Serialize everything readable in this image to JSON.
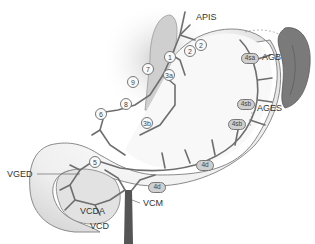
{
  "diagram": {
    "type": "anatomical-illustration",
    "colors": {
      "background": "#ffffff",
      "stomach_fill": "#e9e9e9",
      "vessel": "#6e6e6e",
      "spleen": "#7a7a7a",
      "portal_trunk": "#555555",
      "label_text": "#333333"
    },
    "labels": {
      "apis": "APIS",
      "agb": "AGB",
      "ages": "AGES",
      "vged": "VGED",
      "vcda": "VCDA",
      "vcm": "VCM",
      "vcd": "VCD"
    },
    "nodes": [
      {
        "id": "1",
        "label": "1"
      },
      {
        "id": "2a",
        "label": "2"
      },
      {
        "id": "2b",
        "label": "2"
      },
      {
        "id": "3a",
        "label": "3a"
      },
      {
        "id": "3b",
        "label": "3b"
      },
      {
        "id": "4sa",
        "label": "4sa"
      },
      {
        "id": "4sb1",
        "label": "4sb"
      },
      {
        "id": "4sb2",
        "label": "4sb"
      },
      {
        "id": "4d1",
        "label": "4d"
      },
      {
        "id": "4d2",
        "label": "4d"
      },
      {
        "id": "5",
        "label": "5"
      },
      {
        "id": "6",
        "label": "6"
      },
      {
        "id": "7",
        "label": "7"
      },
      {
        "id": "8",
        "label": "8"
      },
      {
        "id": "9",
        "label": "9"
      }
    ]
  }
}
